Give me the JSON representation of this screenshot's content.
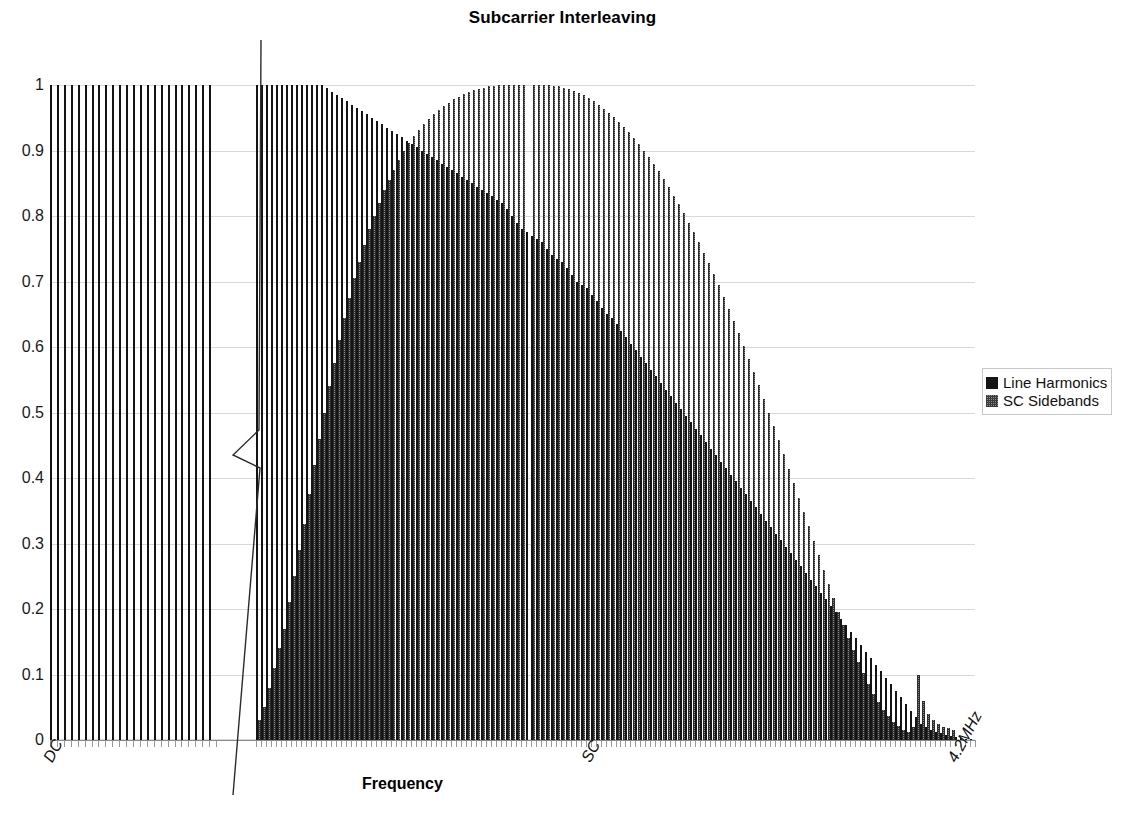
{
  "chart_data": {
    "type": "bar",
    "title": "Subcarrier Interleaving",
    "xlabel": "Frequency",
    "ylabel": "",
    "ylim": [
      0,
      1
    ],
    "yticks": [
      "0",
      "0.1",
      "0.2",
      "0.3",
      "0.4",
      "0.5",
      "0.6",
      "0.7",
      "0.8",
      "0.9",
      "1"
    ],
    "grid": true,
    "legend_position": "right",
    "xtick_labels": [
      "DC",
      "SC",
      "4.2MHz"
    ],
    "axis_break": true,
    "axis_break_note": "frequency axis compressed between the low-frequency harmonic group and the main interleaved region",
    "series": [
      {
        "name": "Line Harmonics",
        "color": "#141414",
        "pattern": "solid",
        "segment_low": {
          "note": "uniform full-amplitude line harmonics near DC",
          "values": [
            1,
            1,
            1,
            1,
            1,
            1,
            1,
            1,
            1,
            1,
            1,
            1,
            1,
            1,
            1,
            1,
            1,
            1,
            1,
            1,
            1,
            1,
            1,
            1
          ]
        },
        "segment_main": {
          "note": "harmonics decaying from unity toward 4.2MHz",
          "values": [
            1,
            1,
            1,
            1,
            1,
            1,
            1,
            1,
            1,
            1,
            1,
            1,
            1,
            1,
            0.995,
            0.99,
            0.985,
            0.98,
            0.975,
            0.97,
            0.965,
            0.96,
            0.955,
            0.95,
            0.945,
            0.94,
            0.935,
            0.93,
            0.925,
            0.92,
            0.915,
            0.91,
            0.905,
            0.9,
            0.895,
            0.89,
            0.885,
            0.88,
            0.875,
            0.87,
            0.865,
            0.86,
            0.855,
            0.85,
            0.845,
            0.84,
            0.835,
            0.83,
            0.825,
            0.82,
            0.81,
            0.8,
            0.79,
            0.78,
            0.775,
            0.77,
            0.765,
            0.76,
            0.75,
            0.74,
            0.735,
            0.73,
            0.72,
            0.71,
            0.7,
            0.695,
            0.69,
            0.68,
            0.67,
            0.66,
            0.65,
            0.645,
            0.635,
            0.625,
            0.615,
            0.605,
            0.595,
            0.585,
            0.575,
            0.565,
            0.555,
            0.545,
            0.535,
            0.525,
            0.515,
            0.505,
            0.495,
            0.485,
            0.475,
            0.465,
            0.455,
            0.445,
            0.435,
            0.425,
            0.415,
            0.405,
            0.395,
            0.385,
            0.375,
            0.365,
            0.355,
            0.345,
            0.335,
            0.325,
            0.315,
            0.305,
            0.295,
            0.285,
            0.275,
            0.265,
            0.255,
            0.245,
            0.235,
            0.225,
            0.215,
            0.205,
            0.195,
            0.185,
            0.175,
            0.165,
            0.155,
            0.145,
            0.135,
            0.125,
            0.115,
            0.105,
            0.095,
            0.085,
            0.075,
            0.065,
            0.055,
            0.045,
            0.035,
            0.025,
            0.02,
            0.015,
            0.012,
            0.01,
            0.008,
            0.006,
            0.004,
            0.003,
            0.002,
            0.001
          ]
        }
      },
      {
        "name": "SC Sidebands",
        "color": "#8c8c8c",
        "pattern": "stippled",
        "segment_low": {
          "note": "no sideband energy near DC",
          "values": []
        },
        "segment_main": {
          "note": "sidebands rise toward the subcarrier peak then decay toward 4.2MHz",
          "values": [
            0.03,
            0.05,
            0.08,
            0.11,
            0.14,
            0.17,
            0.21,
            0.25,
            0.29,
            0.33,
            0.375,
            0.42,
            0.46,
            0.5,
            0.54,
            0.575,
            0.61,
            0.645,
            0.675,
            0.705,
            0.73,
            0.755,
            0.78,
            0.8,
            0.82,
            0.84,
            0.855,
            0.87,
            0.885,
            0.9,
            0.912,
            0.922,
            0.932,
            0.94,
            0.948,
            0.955,
            0.962,
            0.968,
            0.973,
            0.978,
            0.982,
            0.986,
            0.989,
            0.992,
            0.994,
            0.996,
            0.998,
            0.999,
            1.0,
            1.0,
            1.0,
            1.0,
            1.0,
            1.0,
            0,
            1.0,
            1.0,
            1.0,
            1.0,
            0.999,
            0.998,
            0.996,
            0.994,
            0.991,
            0.988,
            0.984,
            0.98,
            0.975,
            0.97,
            0.964,
            0.958,
            0.951,
            0.944,
            0.936,
            0.928,
            0.919,
            0.91,
            0.9,
            0.89,
            0.879,
            0.868,
            0.856,
            0.844,
            0.831,
            0.818,
            0.804,
            0.79,
            0.775,
            0.76,
            0.744,
            0.728,
            0.711,
            0.694,
            0.676,
            0.658,
            0.64,
            0.621,
            0.602,
            0.582,
            0.562,
            0.542,
            0.521,
            0.5,
            0.479,
            0.458,
            0.436,
            0.414,
            0.392,
            0.37,
            0.348,
            0.326,
            0.304,
            0.282,
            0.26,
            0.238,
            0.217,
            0.196,
            0.176,
            0.156,
            0.137,
            0.119,
            0.102,
            0.086,
            0.071,
            0.058,
            0.046,
            0.036,
            0.028,
            0.021,
            0.016,
            0.012,
            0.02,
            0.1,
            0.06,
            0.04,
            0.03,
            0.025,
            0.02,
            0.018,
            0.015
          ]
        }
      }
    ]
  },
  "legend": {
    "items": [
      {
        "label": "Line Harmonics",
        "swatch": "harmonic"
      },
      {
        "label": "SC Sidebands",
        "swatch": "sideband"
      }
    ]
  }
}
